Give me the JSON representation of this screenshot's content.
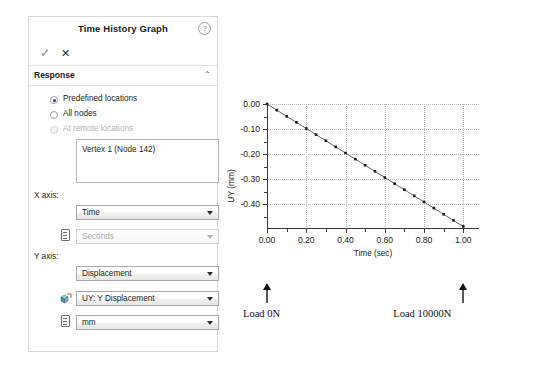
{
  "panel": {
    "title": "Time History Graph",
    "help_icon": "help-question-icon",
    "accept_icon": "checkmark-icon",
    "accept_label": "✓",
    "cancel_icon": "close-x-icon",
    "cancel_label": "✕",
    "section": {
      "label": "Response",
      "chevron": "⌃"
    },
    "radios": [
      {
        "label": "Predefined locations",
        "checked": true,
        "disabled": false
      },
      {
        "label": "All nodes",
        "checked": false,
        "disabled": false
      },
      {
        "label": "At remote locations",
        "checked": false,
        "disabled": true
      }
    ],
    "selection_list": {
      "items": [
        "Vertex 1 (Node 142)"
      ]
    },
    "x_axis": {
      "label": "X axis:",
      "quantity": {
        "value": "Time",
        "disabled": false
      },
      "unit": {
        "value": "Seconds",
        "disabled": true,
        "icon": "unit-ruler-icon"
      }
    },
    "y_axis": {
      "label": "Y axis:",
      "quantity": {
        "value": "Displacement",
        "disabled": false
      },
      "component": {
        "value": "UY: Y Displacement",
        "disabled": false,
        "icon": "vector-component-icon"
      },
      "unit": {
        "value": "mm",
        "disabled": false,
        "icon": "unit-ruler-icon"
      }
    }
  },
  "annotations": [
    {
      "name": "load-start",
      "text": "Load 0N",
      "arrow": "up-arrow-icon",
      "x_value": 0.0
    },
    {
      "name": "load-end",
      "text": "Load 10000N",
      "arrow": "up-arrow-icon",
      "x_value": 1.0
    }
  ],
  "chart_data": {
    "type": "line",
    "title": "",
    "xlabel": "Time (sec)",
    "ylabel": "UY (mm)",
    "xlim": [
      0.0,
      1.08
    ],
    "ylim": [
      -0.5,
      0.0
    ],
    "xticks": [
      0.0,
      0.2,
      0.4,
      0.6,
      0.8,
      1.0
    ],
    "xtick_labels": [
      "0.00",
      "0.20",
      "0.40",
      "0.60",
      "0.80",
      "1.00"
    ],
    "yticks": [
      0.0,
      -0.1,
      -0.2,
      -0.3,
      -0.4
    ],
    "ytick_labels": [
      "0.00",
      "-0.10",
      "-0.20",
      "-0.30",
      "-0.40"
    ],
    "grid": true,
    "grid_style": "dotted",
    "legend": false,
    "marker": "square",
    "line_color": "#555555",
    "marker_color": "#1a1a1a",
    "series": [
      {
        "name": "UY",
        "x": [
          0.0,
          0.05,
          0.1,
          0.15,
          0.2,
          0.25,
          0.3,
          0.35,
          0.4,
          0.45,
          0.5,
          0.55,
          0.6,
          0.65,
          0.7,
          0.75,
          0.8,
          0.85,
          0.9,
          0.95,
          1.0
        ],
        "y": [
          0.0,
          -0.0245,
          -0.049,
          -0.0735,
          -0.098,
          -0.1225,
          -0.147,
          -0.1715,
          -0.196,
          -0.2205,
          -0.245,
          -0.2695,
          -0.294,
          -0.3185,
          -0.343,
          -0.3675,
          -0.392,
          -0.4165,
          -0.441,
          -0.4655,
          -0.49
        ]
      }
    ]
  }
}
